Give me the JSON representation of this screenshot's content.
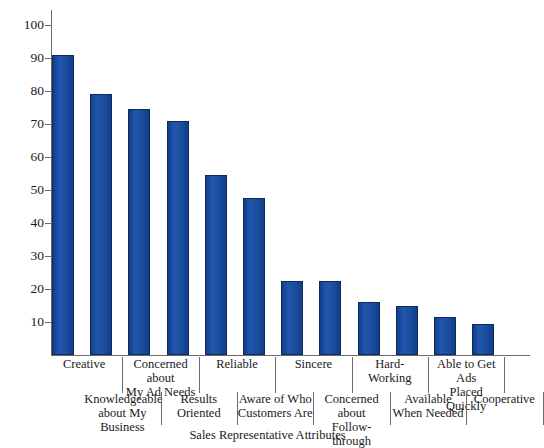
{
  "chart_data": {
    "type": "bar",
    "title": "",
    "xlabel": "Sales Representative Attributes",
    "ylabel": "",
    "ylim": [
      0,
      105
    ],
    "yticks": [
      10,
      20,
      30,
      40,
      50,
      60,
      70,
      80,
      90,
      100
    ],
    "grid": false,
    "legend": "none",
    "bar_color": "#1b4ea0",
    "bar_edge_color": "#0d2a5c",
    "axis_color": "#6b6b6b",
    "categories": [
      "Creative",
      "Knowledgeable about My Business",
      "Concerned about My Ad Needs",
      "Results Oriented",
      "Reliable",
      "Aware of Who Customers Are",
      "Sincere",
      "Concerned about Follow-through",
      "Hard-Working",
      "Available When Needed",
      "Able to Get Ads Placed Quickly",
      "Cooperative"
    ],
    "values": [
      91,
      79,
      74.5,
      71,
      54.5,
      47.5,
      22.5,
      22.5,
      16,
      15,
      11.5,
      9.5
    ]
  },
  "axis": {
    "tick_labels": [
      "100",
      "90",
      "80",
      "70",
      "60",
      "50",
      "40",
      "30",
      "20",
      "10"
    ],
    "x_title": "Sales Representative Attributes"
  },
  "category_labels": {
    "top_row": [
      {
        "line1": "Creative",
        "line2": ""
      },
      {
        "line1": "Concerned about",
        "line2": "My Ad Needs"
      },
      {
        "line1": "Reliable",
        "line2": ""
      },
      {
        "line1": "Sincere",
        "line2": ""
      },
      {
        "line1": "Hard-",
        "line2": "Working"
      },
      {
        "line1": "Able to Get Ads",
        "line2": "Placed Quickly"
      }
    ],
    "bottom_row": [
      {
        "line1": "Knowledgeable",
        "line2": "about My Business"
      },
      {
        "line1": "Results",
        "line2": "Oriented"
      },
      {
        "line1": "Aware of Who",
        "line2": "Customers Are"
      },
      {
        "line1": "Concerned about",
        "line2": "Follow-through"
      },
      {
        "line1": "Available",
        "line2": "When Needed"
      },
      {
        "line1": "Cooperative",
        "line2": ""
      }
    ]
  }
}
